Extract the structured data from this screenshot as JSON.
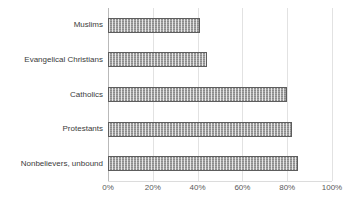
{
  "chart_data": {
    "type": "bar",
    "orientation": "horizontal",
    "title": "",
    "subtitle": "",
    "xlabel": "",
    "ylabel": "",
    "categories": [
      "Muslims",
      "Evangelical Christians",
      "Catholics",
      "Protestants",
      "Nonbelievers, unbound"
    ],
    "values": [
      41,
      44,
      80,
      82,
      85
    ],
    "value_unit": "%",
    "xlim": [
      0,
      100
    ],
    "xticks": [
      0,
      20,
      40,
      60,
      80,
      100
    ],
    "xtick_labels": [
      "0%",
      "20%",
      "40%",
      "60%",
      "80%",
      "100%"
    ],
    "grid": true,
    "grid_axis": "x",
    "legend": false,
    "legend_position": "none",
    "series": [
      {
        "name": "",
        "values": [
          41,
          44,
          80,
          82,
          85
        ]
      }
    ],
    "bar_fill": "#a6a6a6",
    "bar_border": "#5d5d5d",
    "grid_color": "#e2e2e2",
    "axis_color": "#b9b9b9",
    "label_color": "#3b3b3b",
    "tick_color": "#5a5a5a",
    "background": "#ffffff"
  }
}
